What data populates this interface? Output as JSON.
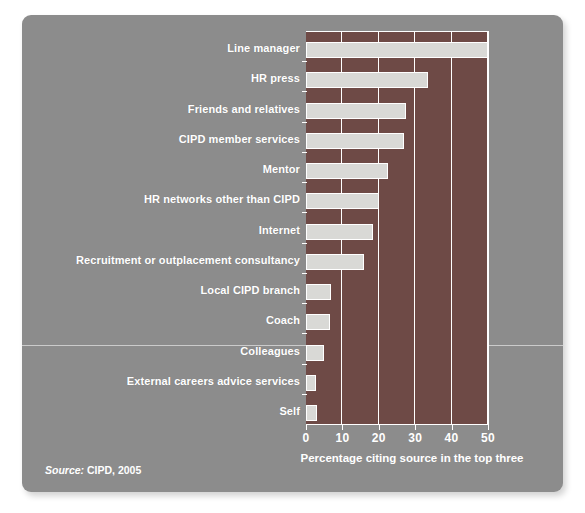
{
  "chart": {
    "source_prefix": "Source:",
    "source_value": "CIPD, 2005",
    "xaxis_title": "Percentage citing source in the top three"
  },
  "colors": {
    "panel_background": "#8c8c8c",
    "plot_background": "#6e4a46",
    "bar_fill": "#d9d9d6",
    "text": "#ffffff",
    "gridline": "#ffffff"
  },
  "chart_data": {
    "type": "bar",
    "orientation": "horizontal",
    "title": "",
    "subtitle": "",
    "xlabel": "Percentage citing source in the top three",
    "ylabel": "",
    "xlim": [
      0,
      50
    ],
    "xticks": [
      0,
      10,
      20,
      30,
      40,
      50
    ],
    "xticklabels": [
      "0",
      "10",
      "20",
      "30",
      "40",
      "50"
    ],
    "grid": true,
    "grid_axis": "x",
    "legend": false,
    "legend_position": "none",
    "source": "Source: CIPD, 2005",
    "categories": [
      "Line manager",
      "HR press",
      "Friends and relatives",
      "CIPD member services",
      "Mentor",
      "HR networks other than CIPD",
      "Internet",
      "Recruitment or outplacement consultancy",
      "Local CIPD branch",
      "Coach",
      "Colleagues",
      "External careers advice services",
      "Self"
    ],
    "values": [
      50,
      33.5,
      27.5,
      27,
      22.5,
      20,
      18.5,
      16,
      7,
      6.5,
      5,
      2.8,
      3
    ]
  }
}
